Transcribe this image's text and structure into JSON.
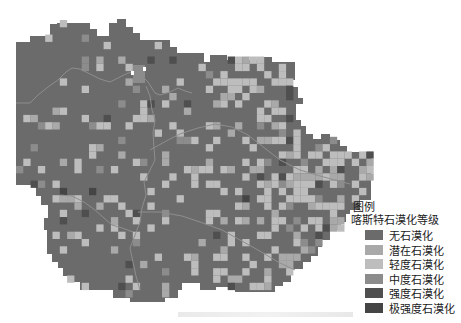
{
  "map": {
    "base_color": "#6b6b6b",
    "river_color": "#8a8a8a",
    "cell_size": 7.3
  },
  "legend": {
    "title": "图例",
    "subtitle": "喀斯特石漠化等级",
    "items": [
      {
        "label": "无石漠化",
        "color": "#6b6b6b"
      },
      {
        "label": "潜在石漠化",
        "color": "#a9a9a9"
      },
      {
        "label": "轻度石漠化",
        "color": "#bdbdbd"
      },
      {
        "label": "中度石漠化",
        "color": "#8c8c8c"
      },
      {
        "label": "强度石漠化",
        "color": "#4f4f4f"
      },
      {
        "label": "极强度石漠化",
        "color": "#454545"
      }
    ]
  }
}
